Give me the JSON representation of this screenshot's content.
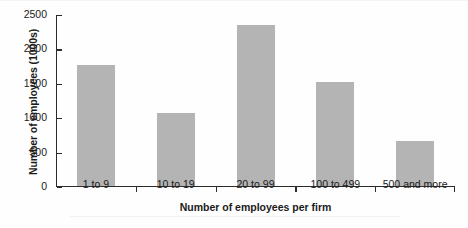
{
  "chart_data": {
    "type": "bar",
    "title": "",
    "xlabel": "Number of employees per firm",
    "ylabel": "Number of employees (1000s)",
    "categories": [
      "1 to 9",
      "10 to 19",
      "20 to 99",
      "100 to 499",
      "500 and more"
    ],
    "values": [
      1750,
      1050,
      2330,
      1510,
      650
    ],
    "ylim": [
      0,
      2500
    ],
    "yticks": [
      0,
      500,
      1000,
      1500,
      2000,
      2500
    ],
    "ytick_labels": [
      "0",
      "500",
      "1000",
      "1500",
      "2000",
      "2500"
    ],
    "grid": false,
    "legend": null,
    "bar_color": "#b4b4b4",
    "axis_color": "#2b2b2b",
    "background_color": "#fefefe"
  }
}
